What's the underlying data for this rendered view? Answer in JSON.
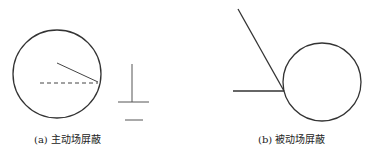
{
  "figure": {
    "panel_a": {
      "caption": "(a) 主动场屏蔽",
      "elements": [
        "circle-conductor",
        "radius-line",
        "dashed-line",
        "ground-symbol"
      ]
    },
    "panel_b": {
      "caption": "(b) 被动场屏蔽",
      "elements": [
        "circle-conductor",
        "diagonal-line",
        "horizontal-line"
      ]
    },
    "colors": {
      "stroke": "#333333",
      "background": "#ffffff"
    }
  }
}
